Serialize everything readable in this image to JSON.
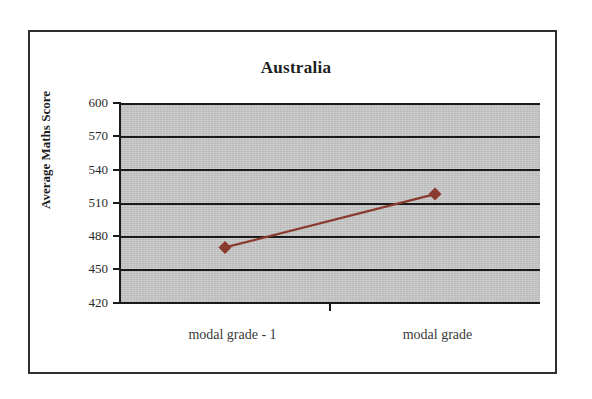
{
  "chart_data": {
    "type": "line",
    "title": "Australia",
    "xlabel": "",
    "ylabel": "Average Maths Score",
    "categories": [
      "modal grade - 1",
      "modal grade"
    ],
    "values": [
      470,
      518
    ],
    "series": [
      {
        "name": "Average Maths Score",
        "values": [
          470,
          518
        ],
        "color": "#8a3a2e",
        "marker": "diamond"
      }
    ],
    "ylim": [
      420,
      600
    ],
    "yticks": [
      420,
      450,
      480,
      510,
      540,
      570,
      600
    ],
    "ytick_labels": [
      "420",
      "450",
      "480",
      "510",
      "540",
      "570",
      "600"
    ],
    "grid": true,
    "grid_axis": "y",
    "legend": false,
    "legend_position": "none",
    "plot_background": "#c9c9c9",
    "gridline_color": "#1a1a1a",
    "figure_background": "#ffffff",
    "frame_color": "#2e2e2e"
  }
}
